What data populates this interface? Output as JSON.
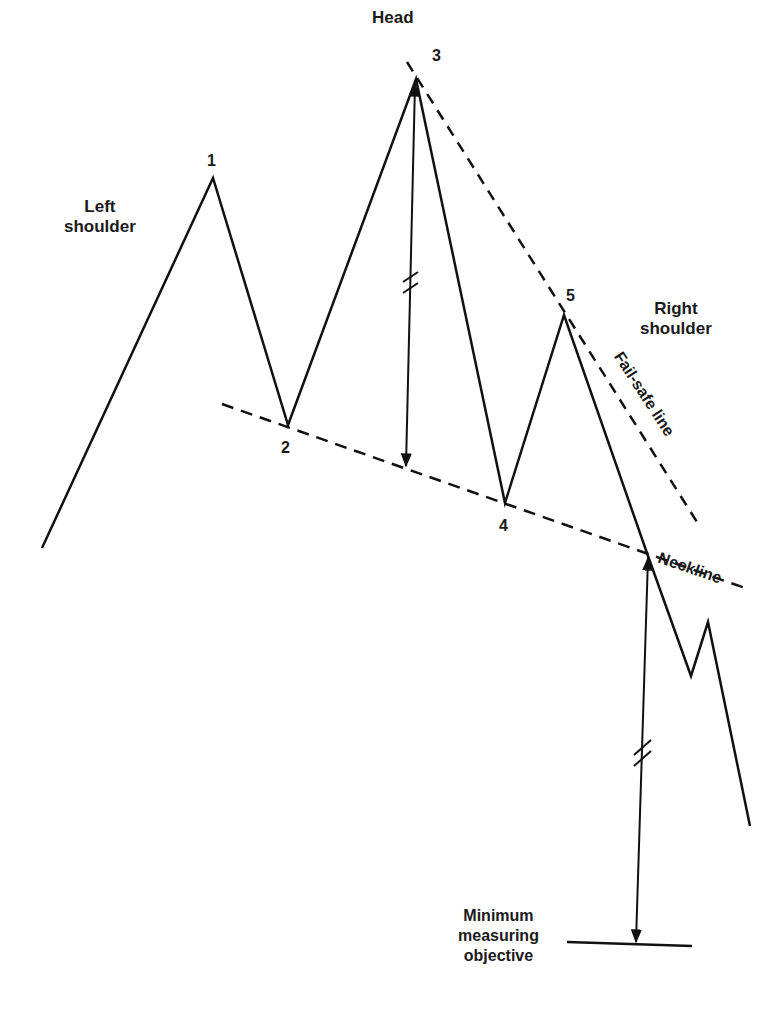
{
  "diagram": {
    "labels": {
      "head": "Head",
      "left_shoulder": "Left\nshoulder",
      "right_shoulder": "Right\nshoulder",
      "fail_safe_line": "Fail-safe line",
      "neckline": "Neckline",
      "minimum_objective": "Minimum\nmeasuring\nobjective"
    },
    "points": [
      {
        "id": "1",
        "label": "1",
        "x": 213,
        "y": 178
      },
      {
        "id": "2",
        "label": "2",
        "x": 288,
        "y": 425
      },
      {
        "id": "3",
        "label": "3",
        "x": 416,
        "y": 79
      },
      {
        "id": "4",
        "label": "4",
        "x": 505,
        "y": 503
      },
      {
        "id": "5",
        "label": "5",
        "x": 564,
        "y": 315
      }
    ],
    "price_path": [
      [
        42,
        548
      ],
      [
        213,
        178
      ],
      [
        288,
        425
      ],
      [
        416,
        79
      ],
      [
        505,
        503
      ],
      [
        564,
        315
      ],
      [
        648,
        556
      ],
      [
        691,
        676
      ],
      [
        708,
        622
      ],
      [
        750,
        826
      ]
    ],
    "neckline": {
      "from": [
        222,
        404
      ],
      "to": [
        745,
        588
      ],
      "style": "dashed"
    },
    "fail_safe_line": {
      "from": [
        407,
        62
      ],
      "to": [
        697,
        522
      ],
      "style": "dashed"
    },
    "head_measure": {
      "from": [
        416,
        82
      ],
      "to": [
        406,
        468
      ],
      "break_marks_y": 285
    },
    "objective_measure": {
      "from": [
        648,
        556
      ],
      "to": [
        636,
        944
      ],
      "break_marks_y": 750
    },
    "objective_line": {
      "from": [
        567,
        942
      ],
      "to": [
        692,
        946
      ]
    },
    "line_color": "#111111"
  }
}
